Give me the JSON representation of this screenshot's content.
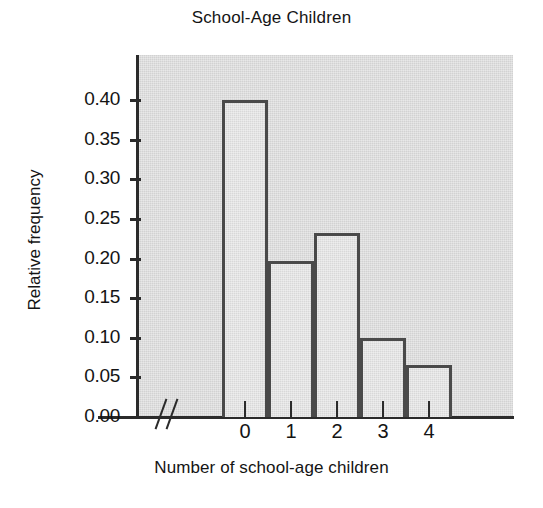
{
  "chart_data": {
    "type": "bar",
    "title": "School-Age Children",
    "xlabel": "Number of school-age children",
    "ylabel": "Relative frequency",
    "categories": [
      "0",
      "1",
      "2",
      "3",
      "4"
    ],
    "values": [
      0.4,
      0.197,
      0.232,
      0.1,
      0.066
    ],
    "ylim": [
      0.0,
      0.44
    ],
    "yticks": [
      0.0,
      0.05,
      0.1,
      0.15,
      0.2,
      0.25,
      0.3,
      0.35,
      0.4
    ],
    "ytick_labels": [
      "0.00",
      "0.05",
      "0.10",
      "0.15",
      "0.20",
      "0.25",
      "0.30",
      "0.35",
      "0.40"
    ],
    "grid": false,
    "legend": null,
    "annotations": [
      {
        "name": "x-axis-break",
        "glyph": "//",
        "description": "double-slash axis break between the vertical axis and the first bar"
      }
    ],
    "style": {
      "plot_background": "#d2d2d2",
      "bar_fill": "#d8d8d8",
      "bar_outline": "#4a4a4a",
      "axis_color": "#2b2b2b",
      "text_color": "#141414",
      "page_background": "#ffffff"
    }
  }
}
